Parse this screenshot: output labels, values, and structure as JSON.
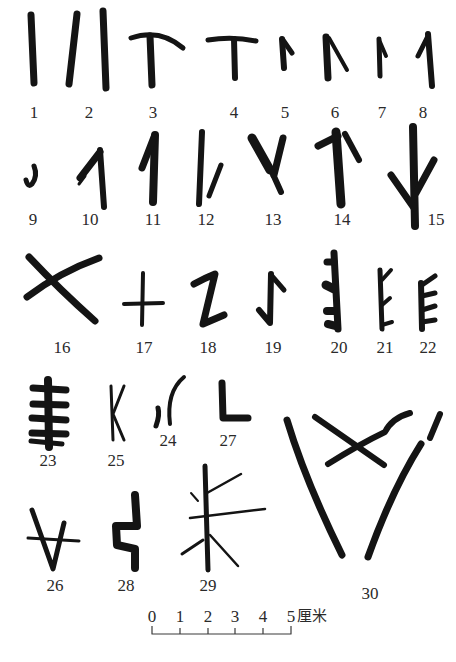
{
  "figure": {
    "ink_color": "#141414",
    "label_color": "#2a2a2a",
    "background": "#ffffff",
    "signs": [
      {
        "id": "1",
        "label": "1",
        "label_x": 34,
        "label_y": 104
      },
      {
        "id": "2",
        "label": "2",
        "label_x": 89,
        "label_y": 104
      },
      {
        "id": "3",
        "label": "3",
        "label_x": 153,
        "label_y": 104
      },
      {
        "id": "4",
        "label": "4",
        "label_x": 234,
        "label_y": 104
      },
      {
        "id": "5",
        "label": "5",
        "label_x": 285,
        "label_y": 104
      },
      {
        "id": "6",
        "label": "6",
        "label_x": 335,
        "label_y": 104
      },
      {
        "id": "7",
        "label": "7",
        "label_x": 382,
        "label_y": 104
      },
      {
        "id": "8",
        "label": "8",
        "label_x": 423,
        "label_y": 104
      },
      {
        "id": "9",
        "label": "9",
        "label_x": 33,
        "label_y": 211
      },
      {
        "id": "10",
        "label": "10",
        "label_x": 90,
        "label_y": 211
      },
      {
        "id": "11",
        "label": "11",
        "label_x": 153,
        "label_y": 211
      },
      {
        "id": "12",
        "label": "12",
        "label_x": 206,
        "label_y": 211
      },
      {
        "id": "13",
        "label": "13",
        "label_x": 273,
        "label_y": 211
      },
      {
        "id": "14",
        "label": "14",
        "label_x": 342,
        "label_y": 211
      },
      {
        "id": "15",
        "label": "15",
        "label_x": 436,
        "label_y": 211
      },
      {
        "id": "16",
        "label": "16",
        "label_x": 62,
        "label_y": 339
      },
      {
        "id": "17",
        "label": "17",
        "label_x": 144,
        "label_y": 339
      },
      {
        "id": "18",
        "label": "18",
        "label_x": 208,
        "label_y": 339
      },
      {
        "id": "19",
        "label": "19",
        "label_x": 273,
        "label_y": 339
      },
      {
        "id": "20",
        "label": "20",
        "label_x": 339,
        "label_y": 339
      },
      {
        "id": "21",
        "label": "21",
        "label_x": 385,
        "label_y": 339
      },
      {
        "id": "22",
        "label": "22",
        "label_x": 428,
        "label_y": 339
      },
      {
        "id": "23",
        "label": "23",
        "label_x": 48,
        "label_y": 452
      },
      {
        "id": "24",
        "label": "24",
        "label_x": 168,
        "label_y": 432
      },
      {
        "id": "25",
        "label": "25",
        "label_x": 116,
        "label_y": 452
      },
      {
        "id": "26",
        "label": "26",
        "label_x": 55,
        "label_y": 577
      },
      {
        "id": "27",
        "label": "27",
        "label_x": 228,
        "label_y": 432
      },
      {
        "id": "28",
        "label": "28",
        "label_x": 126,
        "label_y": 577
      },
      {
        "id": "29",
        "label": "29",
        "label_x": 208,
        "label_y": 577
      },
      {
        "id": "30",
        "label": "30",
        "label_x": 370,
        "label_y": 585
      }
    ]
  },
  "scale_bar": {
    "ticks": [
      "0",
      "1",
      "2",
      "3",
      "4",
      "5"
    ],
    "unit": "厘米"
  }
}
